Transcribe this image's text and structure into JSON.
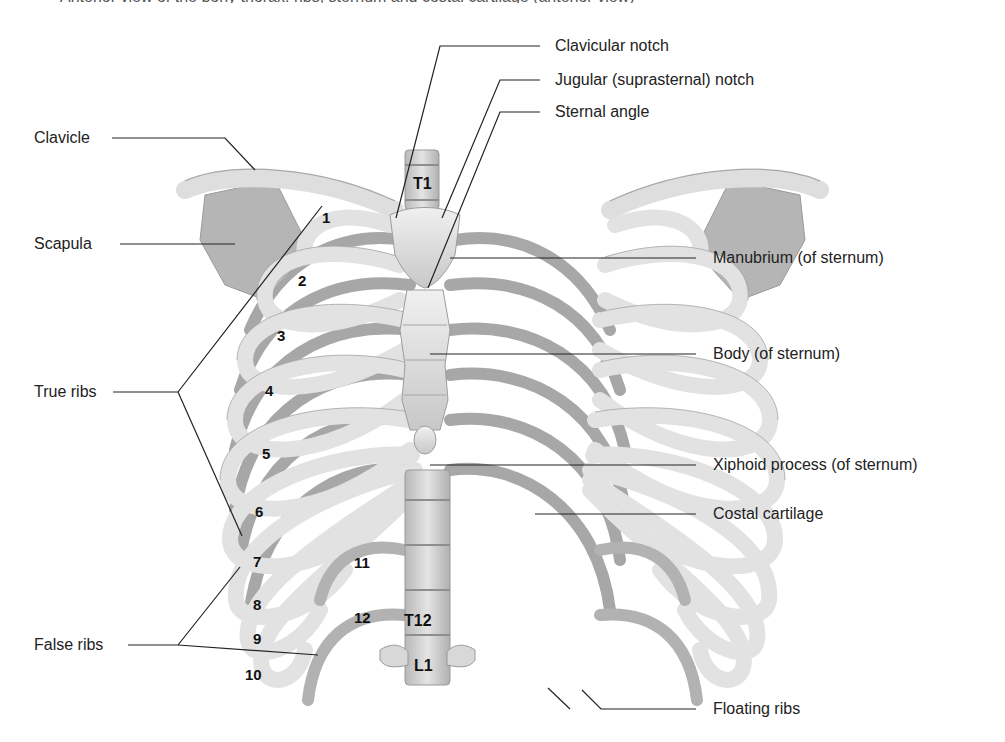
{
  "figure": {
    "caption_partial": "Anterior view of the bony thorax: ribs, sternum and costal cartilage (anterior view)"
  },
  "labels": {
    "clavicular_notch": "Clavicular notch",
    "jugular_notch": "Jugular (suprasternal) notch",
    "sternal_angle": "Sternal angle",
    "clavicle": "Clavicle",
    "scapula": "Scapula",
    "manubrium": "Manubrium (of sternum)",
    "body": "Body (of sternum)",
    "true_ribs": "True ribs",
    "xiphoid": "Xiphoid process (of sternum)",
    "costal_cartilage": "Costal cartilage",
    "false_ribs": "False ribs",
    "floating_ribs": "Floating ribs"
  },
  "rib_numbers": [
    "1",
    "2",
    "3",
    "4",
    "5",
    "6",
    "7",
    "8",
    "9",
    "10",
    "11",
    "12"
  ],
  "vertebrae": {
    "t1": "T1",
    "t12": "T12",
    "l1": "L1"
  },
  "colors": {
    "bone_light": "#e6e6e6",
    "bone_mid": "#c4c4c4",
    "bone_dark": "#9a9a9a",
    "leader_line": "#222222"
  }
}
